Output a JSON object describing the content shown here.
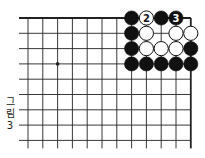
{
  "diagram": {
    "caption": [
      "그",
      "림",
      "3"
    ],
    "colors": {
      "line": "#222222",
      "black_stone": "#111111",
      "white_stone": "#ffffff",
      "background": "#ffffff"
    },
    "grid": {
      "columns": 12,
      "rows": 9,
      "x0": 28,
      "dx": 14.8,
      "y0": 18,
      "dy": 15.3,
      "line_left_extend": 9,
      "line_bottom_extend": 8,
      "edges": [
        "top",
        "right"
      ]
    },
    "star_points": [
      {
        "col": 2,
        "row": 3
      }
    ],
    "stones": [
      {
        "col": 7,
        "row": 0,
        "color": "black"
      },
      {
        "col": 8,
        "row": 0,
        "color": "white",
        "label": "2"
      },
      {
        "col": 9,
        "row": 0,
        "color": "black"
      },
      {
        "col": 10,
        "row": 0,
        "color": "black",
        "label": "3"
      },
      {
        "col": 7,
        "row": 1,
        "color": "black"
      },
      {
        "col": 8,
        "row": 1,
        "color": "white"
      },
      {
        "col": 10,
        "row": 1,
        "color": "white"
      },
      {
        "col": 11,
        "row": 1,
        "color": "white"
      },
      {
        "col": 7,
        "row": 2,
        "color": "black"
      },
      {
        "col": 8,
        "row": 2,
        "color": "white"
      },
      {
        "col": 9,
        "row": 2,
        "color": "white"
      },
      {
        "col": 10,
        "row": 2,
        "color": "white"
      },
      {
        "col": 11,
        "row": 2,
        "color": "black"
      },
      {
        "col": 7,
        "row": 3,
        "color": "black"
      },
      {
        "col": 8,
        "row": 3,
        "color": "black"
      },
      {
        "col": 9,
        "row": 3,
        "color": "black"
      },
      {
        "col": 10,
        "row": 3,
        "color": "black"
      },
      {
        "col": 11,
        "row": 3,
        "color": "black"
      }
    ]
  }
}
